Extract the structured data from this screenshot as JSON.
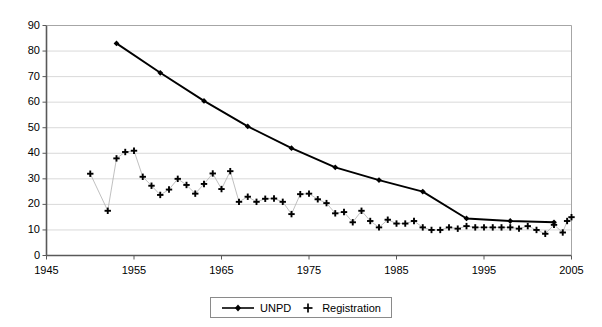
{
  "chart_data": {
    "type": "line",
    "title": "",
    "subtitle": "",
    "xlabel": "",
    "ylabel": "",
    "xlim": [
      1945,
      2005
    ],
    "ylim": [
      0,
      90
    ],
    "ytick_step": 10,
    "xtick_step": 10,
    "grid": "horizontal",
    "legend_position": "bottom-center",
    "xticks": [
      1945,
      1955,
      1965,
      1975,
      1985,
      1995,
      2005
    ],
    "xtick_labels": [
      "1945",
      "1955",
      "1965",
      "1975",
      "1985",
      "1995",
      "2005"
    ],
    "yticks": [
      0,
      10,
      20,
      30,
      40,
      50,
      60,
      70,
      80,
      90
    ],
    "ytick_labels": [
      "0",
      "10",
      "20",
      "30",
      "40",
      "50",
      "60",
      "70",
      "80",
      "90"
    ],
    "series": [
      {
        "name": "UNPD",
        "marker": "diamond",
        "line": "solid",
        "color": "#000000",
        "points": [
          [
            1953,
            83.0
          ],
          [
            1958,
            71.5
          ],
          [
            1963,
            60.5
          ],
          [
            1968,
            50.5
          ],
          [
            1973,
            42.0
          ],
          [
            1978,
            34.5
          ],
          [
            1983,
            29.5
          ],
          [
            1988,
            25.0
          ],
          [
            1993,
            14.5
          ],
          [
            1998,
            13.5
          ],
          [
            2003,
            13.0
          ]
        ]
      },
      {
        "name": "Registration",
        "marker": "plus",
        "line": "thin-grey",
        "color": "#000000",
        "points": [
          [
            1950,
            32.0
          ],
          [
            1952,
            17.5
          ],
          [
            1953,
            38.0
          ],
          [
            1954,
            40.5
          ],
          [
            1955,
            41.0
          ],
          [
            1956,
            30.8
          ],
          [
            1957,
            27.3
          ],
          [
            1958,
            23.7
          ],
          [
            1959,
            25.8
          ],
          [
            1960,
            30.0
          ],
          [
            1961,
            27.6
          ],
          [
            1962,
            24.2
          ],
          [
            1963,
            28.0
          ],
          [
            1964,
            32.1
          ],
          [
            1965,
            26.0
          ],
          [
            1966,
            33.0
          ],
          [
            1967,
            21.0
          ],
          [
            1968,
            23.0
          ],
          [
            1969,
            21.0
          ],
          [
            1970,
            22.2
          ],
          [
            1971,
            22.3
          ],
          [
            1972,
            21.0
          ],
          [
            1973,
            16.2
          ],
          [
            1974,
            24.0
          ],
          [
            1975,
            24.2
          ],
          [
            1976,
            22.0
          ],
          [
            1977,
            20.5
          ],
          [
            1978,
            16.5
          ],
          [
            1979,
            17.0
          ],
          [
            1980,
            13.0
          ],
          [
            1981,
            17.5
          ],
          [
            1982,
            13.5
          ],
          [
            1983,
            11.0
          ],
          [
            1984,
            14.0
          ],
          [
            1985,
            12.5
          ],
          [
            1986,
            12.5
          ],
          [
            1987,
            13.5
          ],
          [
            1988,
            11.0
          ],
          [
            1989,
            10.0
          ],
          [
            1990,
            10.0
          ],
          [
            1991,
            11.0
          ],
          [
            1992,
            10.5
          ],
          [
            1993,
            11.5
          ],
          [
            1994,
            11.0
          ],
          [
            1995,
            11.0
          ],
          [
            1996,
            11.0
          ],
          [
            1997,
            11.0
          ],
          [
            1998,
            11.0
          ],
          [
            1999,
            10.5
          ],
          [
            2000,
            11.5
          ],
          [
            2001,
            10.0
          ],
          [
            2002,
            8.5
          ],
          [
            2003,
            12.0
          ],
          [
            2004,
            9.0
          ],
          [
            2004.5,
            13.5
          ],
          [
            2005,
            15.0
          ]
        ]
      }
    ]
  },
  "legend": {
    "items": [
      {
        "label": "UNPD",
        "marker": "line-diamond"
      },
      {
        "label": "Registration",
        "marker": "plus"
      }
    ]
  },
  "colors": {
    "axis": "#595959",
    "grid": "#d9d9d9",
    "unpd": "#000000",
    "registration": "#000000",
    "registration_connector": "#b0b0b0",
    "background": "#ffffff"
  }
}
